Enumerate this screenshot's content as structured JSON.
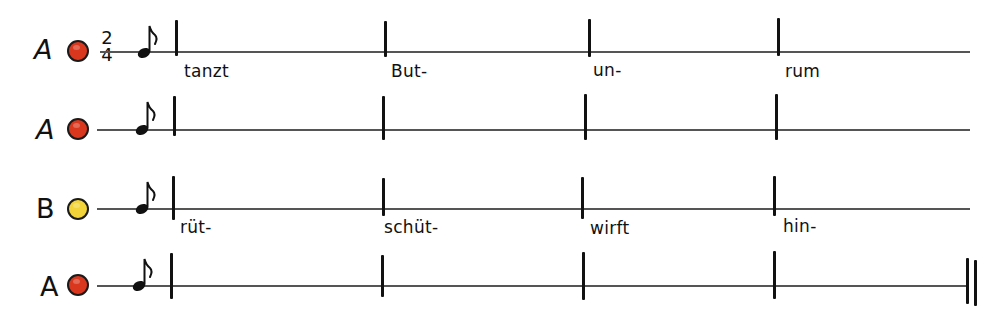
{
  "diagram": {
    "type": "rhythm-notation",
    "time_signature": {
      "numerator": "2",
      "denominator": "4"
    },
    "colors": {
      "A": "#d9381e",
      "B": "#f2d43a",
      "ink": "#111111",
      "line": "#555555"
    },
    "rows": [
      {
        "letter": "A",
        "dot_color": "#d9381e",
        "has_time_signature": true,
        "note": "eighth-note",
        "lyrics": [
          "tanzt",
          "But-",
          "un-",
          "rum"
        ],
        "final_barline": false
      },
      {
        "letter": "A",
        "dot_color": "#d9381e",
        "has_time_signature": false,
        "note": "eighth-note",
        "lyrics": [
          "",
          "",
          "",
          ""
        ],
        "final_barline": false
      },
      {
        "letter": "B",
        "dot_color": "#f2d43a",
        "has_time_signature": false,
        "note": "eighth-note",
        "lyrics": [
          "rüt-",
          "schüt-",
          "wirft",
          "hin-"
        ],
        "final_barline": false
      },
      {
        "letter": "A",
        "dot_color": "#d9381e",
        "has_time_signature": false,
        "note": "eighth-note",
        "lyrics": [
          "",
          "",
          "",
          ""
        ],
        "final_barline": true
      }
    ]
  }
}
